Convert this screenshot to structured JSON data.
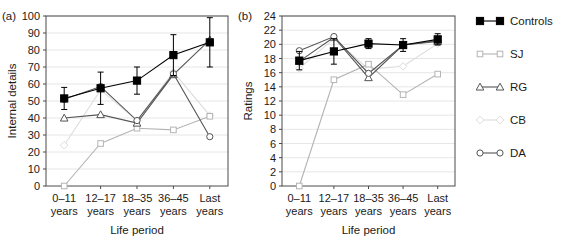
{
  "figure": {
    "panel_a_label": "(a)",
    "panel_b_label": "(b)"
  },
  "legend": {
    "position": "right",
    "entries": [
      {
        "label": "Controls",
        "marker": "filled-square",
        "color": "#000000"
      },
      {
        "label": "SJ",
        "marker": "open-square",
        "color": "#b4b4b4"
      },
      {
        "label": "RG",
        "marker": "open-triangle",
        "color": "#555555"
      },
      {
        "label": "CB",
        "marker": "open-diamond",
        "color": "#dcdcdc"
      },
      {
        "label": "DA",
        "marker": "open-circle",
        "color": "#555555"
      }
    ]
  },
  "chart_data": [
    {
      "panel": "(a)",
      "type": "line",
      "title": "",
      "xlabel": "Life period",
      "ylabel": "Internal details",
      "categories": [
        "0–11 years",
        "12–17 years",
        "18–35 years",
        "36–45 years",
        "Last years"
      ],
      "xtick_lines": [
        [
          "0–11",
          "years"
        ],
        [
          "12–17",
          "years"
        ],
        [
          "18–35",
          "years"
        ],
        [
          "36–45",
          "years"
        ],
        [
          "Last",
          "years"
        ]
      ],
      "ylim": [
        0,
        100
      ],
      "yticks": [
        0,
        10,
        20,
        30,
        40,
        50,
        60,
        70,
        80,
        90,
        100
      ],
      "grid": true,
      "legend_position": "outside-right",
      "series": [
        {
          "name": "Controls",
          "marker": "filled-square",
          "color": "#000000",
          "values": [
            51.5,
            57.5,
            62.0,
            77.0,
            84.5
          ],
          "errors": [
            6.5,
            9.5,
            8.0,
            12.0,
            14.5
          ]
        },
        {
          "name": "SJ",
          "marker": "open-square",
          "color": "#b4b4b4",
          "values": [
            0.0,
            25.0,
            34.0,
            33.0,
            41.0
          ],
          "errors": [
            0,
            0,
            0,
            0,
            0
          ]
        },
        {
          "name": "RG",
          "marker": "open-triangle",
          "color": "#555555",
          "values": [
            40.0,
            42.0,
            37.0,
            65.5,
            86.0
          ],
          "errors": [
            0,
            0,
            0,
            0,
            0
          ]
        },
        {
          "name": "CB",
          "marker": "open-diamond",
          "color": "#dcdcdc",
          "values": [
            24.0,
            56.5,
            38.5,
            67.0,
            41.5
          ],
          "errors": [
            0,
            0,
            0,
            0,
            0
          ]
        },
        {
          "name": "DA",
          "marker": "open-circle",
          "color": "#555555",
          "values": [
            51.0,
            58.5,
            38.5,
            66.0,
            29.0
          ],
          "errors": [
            0,
            0,
            0,
            0,
            0
          ]
        }
      ]
    },
    {
      "panel": "(b)",
      "type": "line",
      "title": "",
      "xlabel": "Life period",
      "ylabel": "Ratings",
      "categories": [
        "0–11 years",
        "12–17 years",
        "18–35 years",
        "36–45 years",
        "Last years"
      ],
      "xtick_lines": [
        [
          "0–11",
          "years"
        ],
        [
          "12–17",
          "years"
        ],
        [
          "18–35",
          "years"
        ],
        [
          "36–45",
          "years"
        ],
        [
          "Last",
          "years"
        ]
      ],
      "ylim": [
        0,
        24
      ],
      "yticks": [
        0,
        2,
        4,
        6,
        8,
        10,
        12,
        14,
        16,
        18,
        20,
        22,
        24
      ],
      "grid": true,
      "legend_position": "outside-right",
      "series": [
        {
          "name": "Controls",
          "marker": "filled-square",
          "color": "#000000",
          "values": [
            17.7,
            19.0,
            20.1,
            19.9,
            20.7
          ],
          "errors": [
            1.3,
            1.8,
            0.7,
            0.9,
            0.8
          ]
        },
        {
          "name": "SJ",
          "marker": "open-square",
          "color": "#b4b4b4",
          "values": [
            0.0,
            15.0,
            17.2,
            12.9,
            15.8
          ],
          "errors": [
            0,
            0,
            0,
            0,
            0
          ]
        },
        {
          "name": "RG",
          "marker": "open-triangle",
          "color": "#555555",
          "values": [
            17.6,
            21.0,
            15.3,
            19.9,
            20.4
          ],
          "errors": [
            0,
            0,
            0,
            0,
            0
          ]
        },
        {
          "name": "CB",
          "marker": "open-diamond",
          "color": "#dcdcdc",
          "values": [
            16.6,
            20.8,
            16.5,
            16.9,
            20.1
          ],
          "errors": [
            0,
            0,
            0,
            0,
            0
          ]
        },
        {
          "name": "DA",
          "marker": "open-circle",
          "color": "#555555",
          "values": [
            19.1,
            21.1,
            15.9,
            19.9,
            20.5
          ],
          "errors": [
            0,
            0,
            0,
            0,
            0
          ]
        }
      ]
    }
  ]
}
